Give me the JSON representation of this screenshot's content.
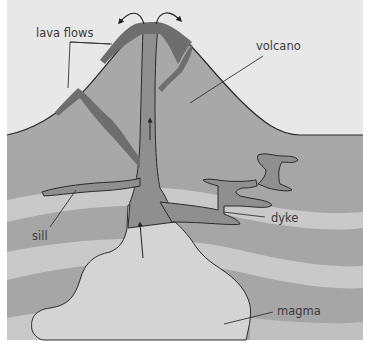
{
  "diagram": {
    "labels": {
      "lava_flows": "lava flows",
      "volcano": "volcano",
      "sill": "sill",
      "dyke": "dyke",
      "magma": "magma"
    },
    "colors": {
      "sky": "#e8e8e8",
      "volcano": "#a8a8a8",
      "rock_dark": "#a6a6a6",
      "rock_light": "#c9c9c9",
      "magma_chamber": "#d4d4d4",
      "conduit": "#8f8f8f",
      "lava": "#6e6e6e",
      "outline": "#2a2a2a"
    }
  }
}
